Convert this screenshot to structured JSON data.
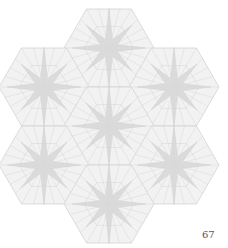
{
  "diagram": {
    "title": "",
    "hexagon_radius": 45,
    "hexagons": [
      {
        "cx": 109,
        "cy": 48
      },
      {
        "cx": 44,
        "cy": 87
      },
      {
        "cx": 174,
        "cy": 87
      },
      {
        "cx": 109,
        "cy": 126
      },
      {
        "cx": 44,
        "cy": 165
      },
      {
        "cx": 174,
        "cy": 165
      },
      {
        "cx": 109,
        "cy": 204
      }
    ],
    "colors": {
      "line": "#d4d4d4",
      "star_fill": "#d9d9d9",
      "hex_fill": "#f2f2f2"
    }
  },
  "page": {
    "number": "67"
  }
}
